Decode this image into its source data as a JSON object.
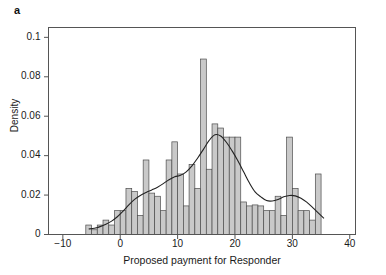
{
  "panel": {
    "label": "a"
  },
  "chart_data": {
    "type": "bar",
    "title": "",
    "subtitle": "",
    "xlabel": "Proposed payment for Responder",
    "ylabel": "Density",
    "xlim": [
      -12.5,
      41
    ],
    "ylim": [
      0,
      0.105
    ],
    "xticks": [
      -10,
      0,
      10,
      20,
      30,
      40
    ],
    "xtick_labels": [
      "−10",
      "0",
      "10",
      "20",
      "30",
      "40"
    ],
    "yticks": [
      0,
      0.02,
      0.04,
      0.06,
      0.08,
      0.1
    ],
    "ytick_labels": [
      "0",
      "0.02",
      "0.04",
      "0.06",
      "0.08",
      "0.1"
    ],
    "grid": false,
    "legend": "none",
    "bin_width": 1,
    "bar_color": "#c9c9c9",
    "bar_edge_color": "#4d4d4d",
    "curve_color": "#222222",
    "axis_color": "#555555",
    "categories": [
      -6,
      -5,
      -4,
      -3,
      -2,
      -1,
      0,
      1,
      2,
      3,
      4,
      5,
      6,
      7,
      8,
      9,
      10,
      11,
      12,
      13,
      14,
      15,
      16,
      17,
      18,
      19,
      20,
      21,
      22,
      23,
      24,
      25,
      26,
      27,
      28,
      29,
      30,
      31,
      32,
      33,
      34,
      35
    ],
    "values": [
      0.0048,
      0.0024,
      0.0048,
      0.0073,
      0.0048,
      0.0121,
      0.0121,
      0.0234,
      0.0218,
      0.0097,
      0.0378,
      0.021,
      0.0194,
      0.0121,
      0.0378,
      0.047,
      0.0307,
      0.0145,
      0.0355,
      0.0234,
      0.089,
      0.0331,
      0.0561,
      0.054,
      0.0494,
      0.0494,
      0.0494,
      0.0165,
      0.0145,
      0.015,
      0.0145,
      0.0121,
      0.0121,
      0.0194,
      0.0097,
      0.0494,
      0.0234,
      0.0121,
      0.0121,
      0.0073,
      0.0307,
      0.0
    ],
    "series": [
      {
        "name": "Kernel density",
        "type": "line",
        "x": [
          -6.0,
          -5.0,
          -4.0,
          -3.0,
          -2.0,
          -1.0,
          0.0,
          1.0,
          2.0,
          3.0,
          4.0,
          5.0,
          6.0,
          7.0,
          8.0,
          9.0,
          10.0,
          11.0,
          12.0,
          13.0,
          14.0,
          15.0,
          16.0,
          17.0,
          18.0,
          19.0,
          20.0,
          21.0,
          22.0,
          23.0,
          24.0,
          25.0,
          26.0,
          27.0,
          28.0,
          29.0,
          30.0,
          31.0,
          32.0,
          33.0,
          34.0,
          35.0
        ],
        "y": [
          0.0028,
          0.0032,
          0.004,
          0.0052,
          0.0068,
          0.009,
          0.0118,
          0.015,
          0.0178,
          0.0198,
          0.0213,
          0.0226,
          0.024,
          0.0258,
          0.0278,
          0.0293,
          0.03,
          0.0318,
          0.0348,
          0.0388,
          0.0432,
          0.0477,
          0.0506,
          0.05,
          0.0468,
          0.0424,
          0.0374,
          0.0318,
          0.0262,
          0.0216,
          0.0191,
          0.0172,
          0.017,
          0.0178,
          0.0191,
          0.0198,
          0.0196,
          0.0184,
          0.0164,
          0.0138,
          0.011,
          0.0082
        ]
      }
    ]
  }
}
